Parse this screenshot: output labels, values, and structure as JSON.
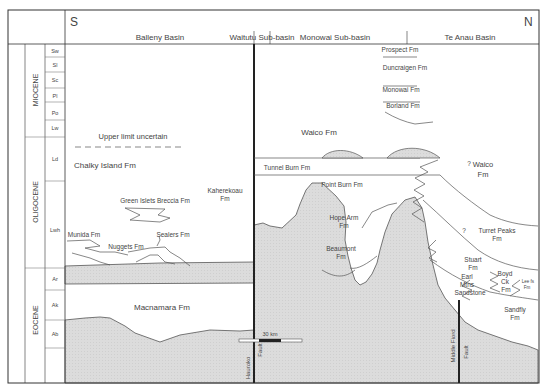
{
  "diagram": {
    "type": "stratigraphic-cross-section",
    "orientation": {
      "left": "S",
      "right": "N"
    },
    "basins": [
      {
        "label": "Balleny Basin"
      },
      {
        "label": "Waitutu Sub-basin"
      },
      {
        "label": "Monowai Sub-basin"
      },
      {
        "label": "Te Anau Basin"
      }
    ],
    "epochs": [
      {
        "label": "MIOCENE"
      },
      {
        "label": "OLIGOCENE"
      },
      {
        "label": "EOCENE"
      }
    ],
    "stages": [
      {
        "label": "Sw"
      },
      {
        "label": "Sl"
      },
      {
        "label": "Sc"
      },
      {
        "label": "Pl"
      },
      {
        "label": "Po"
      },
      {
        "label": "Lw"
      },
      {
        "label": "Ld"
      },
      {
        "label": "Lwh"
      },
      {
        "label": "Ar"
      },
      {
        "label": "Ak"
      },
      {
        "label": "Ab"
      }
    ],
    "formations": {
      "prospect": "Prospect Fm",
      "duncraigen": "Duncraigen Fm",
      "monowai": "Monowai Fm",
      "borland": "Borland Fm",
      "upper_limit": "Upper limit uncertain",
      "waico": "Waico Fm",
      "waico_te_anau_1": "Waico",
      "waico_te_anau_2": "Fm",
      "chalky": "Chalky Island Fm",
      "tunnel_burn": "Tunnel Burn Fm",
      "kaherekoau_1": "Kaherekoau",
      "kaherekoau_2": "Fm",
      "point_burn": "Point Burn Fm",
      "green_islets": "Green Islets Breccia Fm",
      "hope_arm_1": "Hope Arm",
      "hope_arm_2": "Fm",
      "beaumont_1": "Beaumont",
      "beaumont_2": "Fm",
      "turret_1": "Turret Peaks",
      "turret_2": "Fm",
      "munida": "Munida Fm",
      "sealers": "Sealers Fm",
      "nuggets": "Nuggets Fm",
      "stuart_1": "Stuart",
      "stuart_2": "Fm",
      "earl_1": "Earl",
      "earl_2": "Mtns",
      "earl_3": "Sandstone",
      "boyd_1": "Boyd",
      "boyd_2": "Ck",
      "boyd_3": "Fm",
      "lee_1": "Lee fs",
      "lee_2": "Fm",
      "sandfly_1": "Sandfly",
      "sandfly_2": "Fm",
      "macnamara": "Macnamara Fm",
      "question_1": "?",
      "question_2": "?"
    },
    "faults": {
      "hauroko_1": "Hauroko",
      "hauroko_2": "Fault",
      "middle_fiord_1": "Middle Fiord",
      "middle_fiord_2": "Fault"
    },
    "scale_bar": {
      "label": "30 km"
    },
    "colors": {
      "basement_fill": "#d9d9d9",
      "line": "#555555",
      "frame": "#333333"
    }
  }
}
